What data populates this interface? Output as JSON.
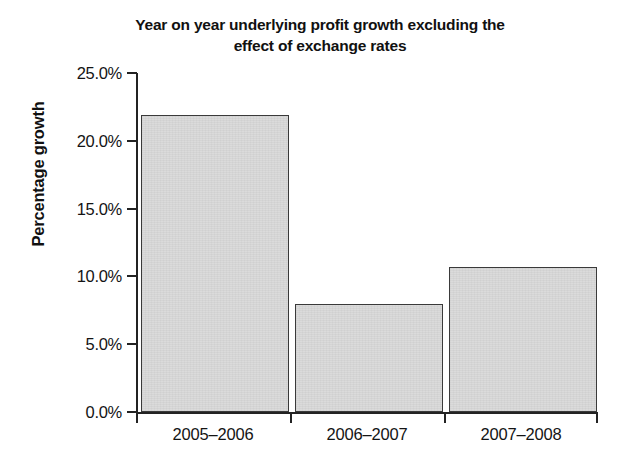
{
  "chart_data": {
    "type": "bar",
    "title": "Year on year underlying profit growth excluding the effect of exchange rates",
    "title_line1": "Year on year underlying profit growth excluding the",
    "title_line2": "effect of exchange rates",
    "xlabel": "",
    "ylabel": "Percentage growth",
    "categories": [
      "2005–2006",
      "2006–2007",
      "2007–2008"
    ],
    "values": [
      21.9,
      8.0,
      10.7
    ],
    "value_unit": "%",
    "ylim": [
      0,
      25
    ],
    "ytick_values": [
      0,
      5,
      10,
      15,
      20,
      25
    ],
    "ytick_labels": [
      "0.0%",
      "5.0%",
      "10.0%",
      "15.0%",
      "20.0%",
      "25.0%"
    ],
    "grid": false,
    "legend": false,
    "legend_position": "none",
    "bar_fill_color": "#d9d9d9",
    "bar_border_color": "#3a3a3a",
    "axis_color": "#232323",
    "text_color": "#141414",
    "background_color": "#ffffff"
  }
}
